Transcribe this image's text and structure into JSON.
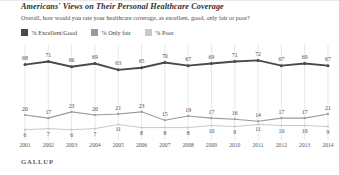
{
  "header": {
    "title": "Americans' Views on Their Personal Healthcare Coverage",
    "subtitle": "Overall, how would you rate your healthcare coverage, as excellent, good, only fair or poor?"
  },
  "footer": {
    "brand": "GALLUP"
  },
  "colors": {
    "excellent_good": "#4a4a4a",
    "only_fair": "#9a9a9a",
    "poor": "#c9c9c9",
    "gridline": "#d8d8d8",
    "text": "#4a4a4a"
  },
  "chart_data": {
    "type": "line",
    "title": "Americans' Views on Their Personal Healthcare Coverage",
    "subtitle": "Overall, how would you rate your healthcare coverage, as excellent, good, only fair or poor?",
    "xlabel": "",
    "ylabel": "",
    "ylim": [
      0,
      80
    ],
    "grid": "vertical",
    "legend_position": "top-left",
    "categories": [
      "2001",
      "2002",
      "2003",
      "2004",
      "2005",
      "2006",
      "2007",
      "2008",
      "2009",
      "2010",
      "2011",
      "2012",
      "2013",
      "2014"
    ],
    "series": [
      {
        "name": "% Excellent/Good",
        "color": "#4a4a4a",
        "values": [
          68,
          71,
          66,
          69,
          63,
          65,
          70,
          67,
          69,
          71,
          72,
          67,
          69,
          67
        ]
      },
      {
        "name": "% Only fair",
        "color": "#9a9a9a",
        "values": [
          20,
          17,
          23,
          20,
          21,
          23,
          15,
          19,
          17,
          16,
          14,
          17,
          17,
          21
        ]
      },
      {
        "name": "% Poor",
        "color": "#c9c9c9",
        "values": [
          6,
          7,
          6,
          7,
          11,
          8,
          8,
          8,
          10,
          9,
          11,
          10,
          10,
          9
        ]
      }
    ]
  }
}
